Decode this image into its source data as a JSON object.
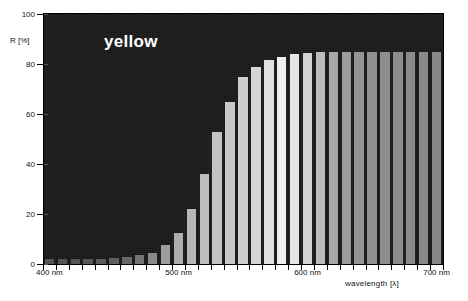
{
  "chart_data": {
    "type": "bar",
    "title": "yellow",
    "xlabel": "wavelength [λ]",
    "ylabel": "R [%]",
    "xlim": [
      395,
      705
    ],
    "ylim": [
      0,
      100
    ],
    "grid": false,
    "legend": "none",
    "x_tick_labels": [
      "400 nm",
      "500 nm",
      "600 nm",
      "700 nm"
    ],
    "x_tick_values": [
      400,
      500,
      600,
      700
    ],
    "y_tick_labels": [
      "0",
      "20",
      "40",
      "60",
      "80",
      "100"
    ],
    "y_tick_values": [
      0,
      20,
      40,
      60,
      80,
      100
    ],
    "categories": [
      400,
      410,
      420,
      430,
      440,
      450,
      460,
      470,
      480,
      490,
      500,
      510,
      520,
      530,
      540,
      550,
      560,
      570,
      580,
      590,
      600,
      610,
      620,
      630,
      640,
      650,
      660,
      670,
      680,
      690,
      700
    ],
    "values": [
      2,
      2,
      2,
      2,
      2,
      2.5,
      3,
      3.5,
      4.5,
      7.5,
      12.5,
      22,
      36,
      53,
      65,
      75,
      79,
      81.5,
      83,
      84,
      84.5,
      85,
      85,
      85,
      85,
      85,
      85,
      85,
      85,
      85,
      85
    ],
    "bar_shades": [
      "#555555",
      "#555555",
      "#565656",
      "#585858",
      "#5b5b5b",
      "#606060",
      "#686868",
      "#757575",
      "#8a8a8a",
      "#9e9e9e",
      "#aeaeae",
      "#b8b8b8",
      "#bdbdbd",
      "#c2c2c2",
      "#c8c8c8",
      "#cfcfcf",
      "#d6d6d6",
      "#e0e0e0",
      "#eeeeee",
      "#e6e6e6",
      "#d2d2d2",
      "#bcbcbc",
      "#a8a8a8",
      "#9c9c9c",
      "#959595",
      "#919191",
      "#8e8e8e",
      "#8c8c8c",
      "#8a8a8a",
      "#898989",
      "#888888"
    ],
    "plot_background": "#1a1a1a",
    "title_color": "#ffffff",
    "axis_color": "#000000"
  }
}
